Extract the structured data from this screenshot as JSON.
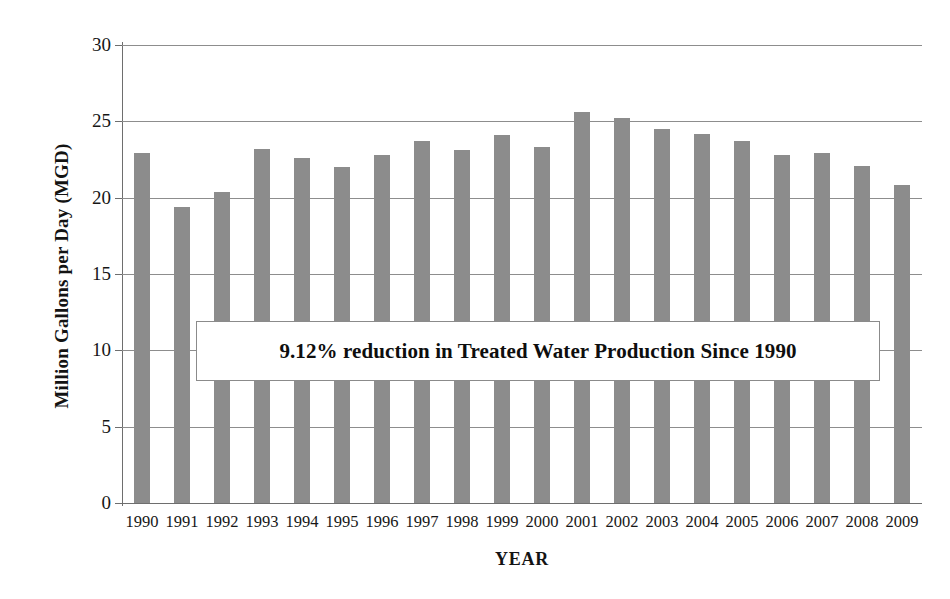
{
  "chart_data": {
    "type": "bar",
    "title": "",
    "xlabel": "YEAR",
    "ylabel": "Million Gallons per Day (MGD)",
    "categories": [
      "1990",
      "1991",
      "1992",
      "1993",
      "1994",
      "1995",
      "1996",
      "1997",
      "1998",
      "1999",
      "2000",
      "2001",
      "2002",
      "2003",
      "2004",
      "2005",
      "2006",
      "2007",
      "2008",
      "2009"
    ],
    "values": [
      22.9,
      19.4,
      20.4,
      23.2,
      22.6,
      22.0,
      22.8,
      23.7,
      23.1,
      24.1,
      23.3,
      25.6,
      25.2,
      24.5,
      24.2,
      23.7,
      22.8,
      22.9,
      22.1,
      20.8
    ],
    "series": [
      {
        "name": "Treated Water Production",
        "values": [
          22.9,
          19.4,
          20.4,
          23.2,
          22.6,
          22.0,
          22.8,
          23.7,
          23.1,
          24.1,
          23.3,
          25.6,
          25.2,
          24.5,
          24.2,
          23.7,
          22.8,
          22.9,
          22.1,
          20.8
        ]
      }
    ],
    "ylim": [
      0,
      30
    ],
    "yticks": [
      0,
      5,
      10,
      15,
      20,
      25,
      30
    ],
    "ytick_labels": [
      "0",
      "5",
      "10",
      "15",
      "20",
      "25",
      "30"
    ],
    "grid": "horizontal",
    "legend": "none",
    "bar_color": "#8c8c8c",
    "annotations": [
      {
        "text": "9.12% reduction in Treated Water Production Since 1990",
        "type": "text-box"
      }
    ]
  }
}
